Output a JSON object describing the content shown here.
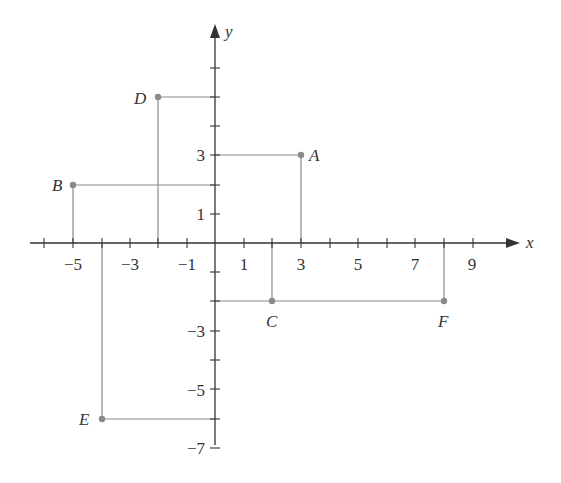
{
  "diagram": {
    "type": "coordinate-plane",
    "x_axis_label": "x",
    "y_axis_label": "y",
    "x_tick_labels": [
      "-5",
      "-3",
      "-1",
      "1",
      "3",
      "5",
      "7",
      "9"
    ],
    "y_tick_labels": [
      "3",
      "1",
      "-3",
      "-5",
      "-7"
    ],
    "x_range": [
      -6,
      10
    ],
    "y_range": [
      -7,
      7
    ],
    "points": [
      {
        "label": "A",
        "x": 3,
        "y": 3
      },
      {
        "label": "B",
        "x": -5,
        "y": 2
      },
      {
        "label": "C",
        "x": 2,
        "y": -2
      },
      {
        "label": "D",
        "x": -2,
        "y": 5
      },
      {
        "label": "E",
        "x": -4,
        "y": -6
      },
      {
        "label": "F",
        "x": 8,
        "y": -2
      }
    ],
    "colors": {
      "axis": "#333333",
      "guide": "#8a8a8a",
      "point": "#8a8a8a"
    }
  },
  "labels": {
    "x": "x",
    "y": "y",
    "xt": {
      "m5": "−5",
      "m3": "−3",
      "m1": "−1",
      "p1": "1",
      "p3": "3",
      "p5": "5",
      "p7": "7",
      "p9": "9"
    },
    "yt": {
      "p3": "3",
      "p1": "1",
      "m3": "−3",
      "m5": "−5",
      "m7": "−7"
    },
    "A": "A",
    "B": "B",
    "C": "C",
    "D": "D",
    "E": "E",
    "F": "F"
  }
}
